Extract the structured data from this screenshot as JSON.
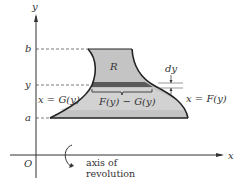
{
  "figure": {
    "axes": {
      "y_label": "y",
      "x_label": "x",
      "origin_label": "O"
    },
    "ticks": {
      "b": "b",
      "y": "y",
      "a": "a"
    },
    "region_label": "R",
    "left_curve_label": "x = G(y)",
    "right_curve_label": "x = F(y)",
    "strip_width_label": "F(y) − G(y)",
    "strip_height_label": "dy",
    "axis_of_revolution_line1": "axis of",
    "axis_of_revolution_line2": "revolution",
    "colors": {
      "region_fill": "#c4c4c4",
      "strip_fill": "#5a5a5a",
      "outline": "#222222",
      "axis": "#333333"
    }
  }
}
